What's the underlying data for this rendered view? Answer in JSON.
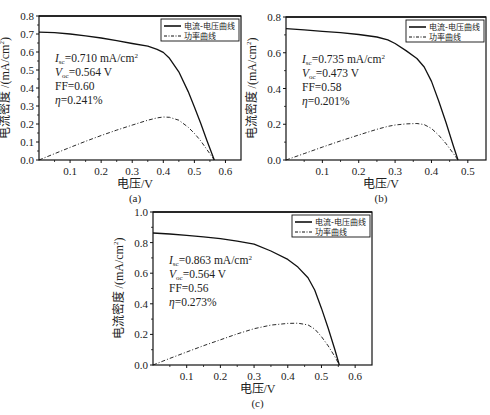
{
  "chart_data": [
    {
      "id": "a",
      "type": "line",
      "caption": "(a)",
      "xlabel": "电压/V",
      "ylabel": "电流密度 /(mA/cm²)",
      "xlim": [
        0,
        0.65
      ],
      "ylim": [
        0,
        0.8
      ],
      "xticks": [
        0.1,
        0.2,
        0.3,
        0.4,
        0.5,
        0.6
      ],
      "xtick_labels": [
        "0.1",
        "0.2",
        "0.3",
        "0.4",
        "0.5",
        "0.6"
      ],
      "yticks": [
        0.0,
        0.1,
        0.2,
        0.3,
        0.4,
        0.5,
        0.6,
        0.7,
        0.8
      ],
      "ytick_labels": [
        "0.0",
        "0.1",
        "0.2",
        "0.3",
        "0.4",
        "0.5",
        "0.6",
        "0.7",
        "0.8"
      ],
      "grid": false,
      "legend": {
        "position": "upper right",
        "entries": [
          "电流-电压曲线",
          "功率曲线"
        ]
      },
      "annotations": [
        "I_sc=0.710 mA/cm²",
        "V_oc=0.564 V",
        "FF=0.60",
        "η=0.241%"
      ],
      "series": [
        {
          "name": "电流-电压曲线",
          "style": "solid",
          "x": [
            0,
            0.05,
            0.1,
            0.15,
            0.2,
            0.25,
            0.3,
            0.35,
            0.38,
            0.4,
            0.42,
            0.45,
            0.48,
            0.5,
            0.52,
            0.54,
            0.564
          ],
          "y": [
            0.71,
            0.707,
            0.7,
            0.69,
            0.678,
            0.663,
            0.647,
            0.632,
            0.615,
            0.598,
            0.565,
            0.49,
            0.38,
            0.295,
            0.205,
            0.11,
            0.0
          ]
        },
        {
          "name": "功率曲线",
          "style": "dashdot",
          "x": [
            0,
            0.05,
            0.1,
            0.15,
            0.2,
            0.25,
            0.3,
            0.35,
            0.38,
            0.4,
            0.42,
            0.45,
            0.48,
            0.5,
            0.52,
            0.54,
            0.564
          ],
          "y": [
            0.0,
            0.035,
            0.07,
            0.104,
            0.136,
            0.166,
            0.194,
            0.221,
            0.234,
            0.239,
            0.237,
            0.221,
            0.182,
            0.148,
            0.107,
            0.059,
            0.0
          ]
        }
      ]
    },
    {
      "id": "b",
      "type": "line",
      "caption": "(b)",
      "xlabel": "电压/V",
      "ylabel": "电流密度 /(mA/cm²)",
      "xlim": [
        0,
        0.55
      ],
      "ylim": [
        0,
        0.8
      ],
      "xticks": [
        0.1,
        0.2,
        0.3,
        0.4,
        0.5
      ],
      "xtick_labels": [
        "0.1",
        "0.2",
        "0.3",
        "0.4",
        "0.5"
      ],
      "yticks": [
        0.0,
        0.2,
        0.4,
        0.6,
        0.8
      ],
      "ytick_labels": [
        "0.0",
        "0.2",
        "0.4",
        "0.6",
        "0.8"
      ],
      "grid": false,
      "legend": {
        "position": "upper right",
        "entries": [
          "电流-电压曲线",
          "功率曲线"
        ]
      },
      "annotations": [
        "I_sc=0.735 mA/cm²",
        "V_oc=0.473 V",
        "FF=0.58",
        "η=0.201%"
      ],
      "series": [
        {
          "name": "电流-电压曲线",
          "style": "solid",
          "x": [
            0,
            0.05,
            0.1,
            0.15,
            0.2,
            0.25,
            0.28,
            0.3,
            0.33,
            0.36,
            0.38,
            0.4,
            0.42,
            0.44,
            0.46,
            0.473
          ],
          "y": [
            0.735,
            0.728,
            0.72,
            0.712,
            0.702,
            0.688,
            0.672,
            0.652,
            0.612,
            0.568,
            0.52,
            0.44,
            0.33,
            0.21,
            0.08,
            0.0
          ]
        },
        {
          "name": "功率曲线",
          "style": "dashdot",
          "x": [
            0,
            0.05,
            0.1,
            0.15,
            0.2,
            0.25,
            0.28,
            0.3,
            0.33,
            0.36,
            0.38,
            0.4,
            0.42,
            0.44,
            0.46,
            0.473
          ],
          "y": [
            0.0,
            0.036,
            0.072,
            0.107,
            0.14,
            0.172,
            0.188,
            0.196,
            0.202,
            0.204,
            0.198,
            0.176,
            0.139,
            0.092,
            0.037,
            0.0
          ]
        }
      ]
    },
    {
      "id": "c",
      "type": "line",
      "caption": "(c)",
      "xlabel": "电压/V",
      "ylabel": "电流密度 /(mA/cm²)",
      "xlim": [
        0,
        0.65
      ],
      "ylim": [
        0,
        1.0
      ],
      "xticks": [
        0.1,
        0.2,
        0.3,
        0.4,
        0.5,
        0.6
      ],
      "xtick_labels": [
        "0.1",
        "0.2",
        "0.3",
        "0.4",
        "0.5",
        "0.6"
      ],
      "yticks": [
        0.0,
        0.2,
        0.4,
        0.6,
        0.8,
        1.0
      ],
      "ytick_labels": [
        "0.0",
        "0.2",
        "0.4",
        "0.6",
        "0.8",
        "1.0"
      ],
      "grid": false,
      "legend": {
        "position": "upper right",
        "entries": [
          "电流-电压曲线",
          "功率曲线"
        ]
      },
      "annotations": [
        "I_sc=0.863 mA/cm²",
        "V_oc=0.564 V",
        "FF=0.56",
        "η=0.273%"
      ],
      "series": [
        {
          "name": "电流-电压曲线",
          "style": "solid",
          "x": [
            0,
            0.05,
            0.1,
            0.15,
            0.2,
            0.25,
            0.3,
            0.35,
            0.4,
            0.43,
            0.46,
            0.48,
            0.5,
            0.52,
            0.54,
            0.553
          ],
          "y": [
            0.863,
            0.856,
            0.848,
            0.838,
            0.826,
            0.81,
            0.79,
            0.745,
            0.69,
            0.64,
            0.57,
            0.49,
            0.37,
            0.24,
            0.1,
            0.0
          ]
        },
        {
          "name": "功率曲线",
          "style": "dashdot",
          "x": [
            0,
            0.05,
            0.1,
            0.15,
            0.2,
            0.25,
            0.3,
            0.35,
            0.4,
            0.43,
            0.46,
            0.48,
            0.5,
            0.52,
            0.54,
            0.553
          ],
          "y": [
            0.0,
            0.043,
            0.085,
            0.126,
            0.165,
            0.203,
            0.237,
            0.261,
            0.272,
            0.273,
            0.262,
            0.235,
            0.185,
            0.125,
            0.054,
            0.0
          ]
        }
      ]
    }
  ]
}
